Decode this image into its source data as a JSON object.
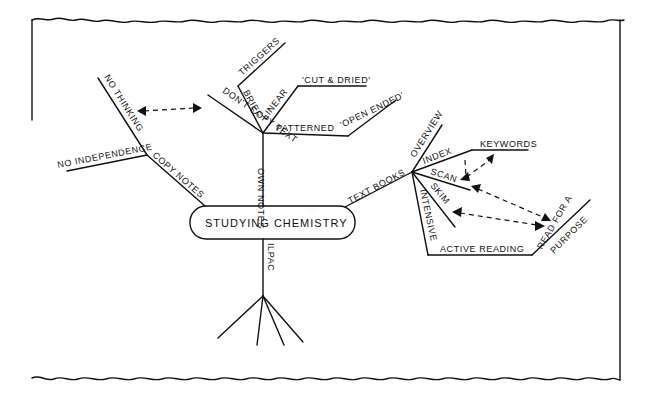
{
  "diagram": {
    "type": "mind-map",
    "center": "STUDYING CHEMISTRY",
    "branches": {
      "copy_notes": {
        "label": "COPY NOTES",
        "children": [
          "NO THINKING",
          "NO INDEPENDENCE"
        ]
      },
      "own_notes": {
        "label": "OWN NOTES",
        "children": {
          "dont_copy": "DON'T COPY TEXT",
          "brief": "BRIEF",
          "triggers": "TRIGGERS",
          "linear": "LINEAR",
          "cut_dried": "'CUT & DRIED'",
          "patterned": "PATTERNED",
          "open_ended": "'OPEN ENDED'"
        }
      },
      "text_books": {
        "label": "TEXT BOOKS",
        "children": {
          "overview": "OVERVIEW",
          "index": "INDEX",
          "keywords": "KEYWORDS",
          "scan": "SCAN",
          "skim": "SKIM",
          "intensive": "INTENSIVE",
          "active_reading": "ACTIVE READING",
          "read_for_a": "READ FOR A",
          "purpose": "PURPOSE"
        }
      },
      "ilpac": {
        "label": "ILPAC",
        "children_count": 4
      }
    },
    "links": [
      {
        "from": "NO THINKING",
        "to": "DON'T COPY TEXT"
      },
      {
        "from": "KEYWORDS",
        "to": "SCAN"
      },
      {
        "from": "SCAN",
        "to": "READ FOR A PURPOSE"
      },
      {
        "from": "SKIM",
        "to": "READ FOR A PURPOSE"
      }
    ]
  }
}
